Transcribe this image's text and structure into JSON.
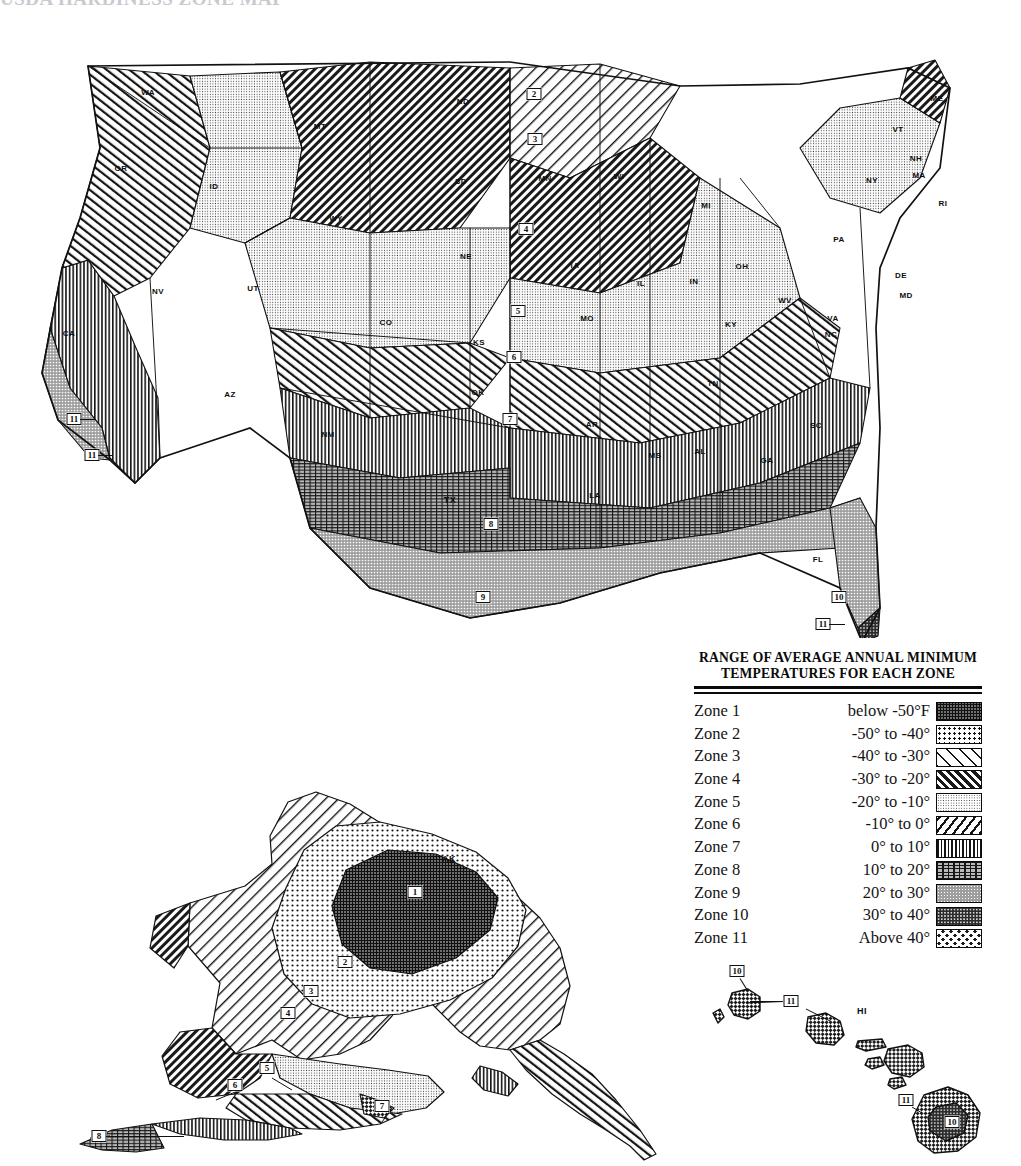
{
  "page": {
    "cut_off_title": "USDA HARDINESS ZONE MAP",
    "background_color": "#ffffff",
    "ink_color": "#111111"
  },
  "legend": {
    "title_line1": "RANGE OF AVERAGE ANNUAL MINIMUM",
    "title_line2": "TEMPERATURES FOR EACH ZONE",
    "columns": [
      "Zone",
      "Temperature range",
      "Pattern"
    ],
    "rows": [
      {
        "zone": "Zone 1",
        "range": "below -50°F",
        "pattern": "p1",
        "pattern_name": "fine-dark-grid"
      },
      {
        "zone": "Zone 2",
        "range": "-50° to -40°",
        "pattern": "p2",
        "pattern_name": "coarse-dots"
      },
      {
        "zone": "Zone 3",
        "range": "-40° to -30°",
        "pattern": "p3",
        "pattern_name": "sparse-backslash-hatch"
      },
      {
        "zone": "Zone 4",
        "range": "-30° to -20°",
        "pattern": "p4",
        "pattern_name": "dense-forward-hatch"
      },
      {
        "zone": "Zone 5",
        "range": "-20° to -10°",
        "pattern": "p5",
        "pattern_name": "fine-stipple"
      },
      {
        "zone": "Zone 6",
        "range": "-10° to   0°",
        "pattern": "p6",
        "pattern_name": "bold-backslash-hatch"
      },
      {
        "zone": "Zone 7",
        "range": "0° to  10°",
        "pattern": "p7",
        "pattern_name": "vertical-bars"
      },
      {
        "zone": "Zone 8",
        "range": "10° to  20°",
        "pattern": "p8",
        "pattern_name": "dash-stipple"
      },
      {
        "zone": "Zone 9",
        "range": "20° to  30°",
        "pattern": "p9",
        "pattern_name": "mid-gray-stipple"
      },
      {
        "zone": "Zone 10",
        "range": "30° to  40°",
        "pattern": "p10",
        "pattern_name": "dark-fine-dots"
      },
      {
        "zone": "Zone 11",
        "range": "Above   40°",
        "pattern": "p11",
        "pattern_name": "bold-checker"
      }
    ]
  },
  "maps": {
    "conus": {
      "name": "contiguous-united-states",
      "state_labels": [
        {
          "abbr": "WA",
          "x": 148,
          "y": 92
        },
        {
          "abbr": "OR",
          "x": 121,
          "y": 168
        },
        {
          "abbr": "ID",
          "x": 214,
          "y": 186
        },
        {
          "abbr": "MT",
          "x": 320,
          "y": 126
        },
        {
          "abbr": "WY",
          "x": 336,
          "y": 218
        },
        {
          "abbr": "NV",
          "x": 158,
          "y": 291
        },
        {
          "abbr": "UT",
          "x": 253,
          "y": 288
        },
        {
          "abbr": "CA",
          "x": 69,
          "y": 333
        },
        {
          "abbr": "AZ",
          "x": 230,
          "y": 394
        },
        {
          "abbr": "NM",
          "x": 328,
          "y": 434
        },
        {
          "abbr": "CO",
          "x": 386,
          "y": 322
        },
        {
          "abbr": "ND",
          "x": 463,
          "y": 101
        },
        {
          "abbr": "SD",
          "x": 461,
          "y": 181
        },
        {
          "abbr": "NE",
          "x": 466,
          "y": 256
        },
        {
          "abbr": "KS",
          "x": 479,
          "y": 342
        },
        {
          "abbr": "OK",
          "x": 478,
          "y": 392
        },
        {
          "abbr": "TX",
          "x": 450,
          "y": 500
        },
        {
          "abbr": "MN",
          "x": 545,
          "y": 178
        },
        {
          "abbr": "IA",
          "x": 575,
          "y": 265
        },
        {
          "abbr": "MO",
          "x": 587,
          "y": 318
        },
        {
          "abbr": "AR",
          "x": 592,
          "y": 424
        },
        {
          "abbr": "LA",
          "x": 595,
          "y": 495
        },
        {
          "abbr": "WI",
          "x": 619,
          "y": 176
        },
        {
          "abbr": "IL",
          "x": 641,
          "y": 283
        },
        {
          "abbr": "MI",
          "x": 706,
          "y": 205
        },
        {
          "abbr": "IN",
          "x": 694,
          "y": 281
        },
        {
          "abbr": "KY",
          "x": 731,
          "y": 324
        },
        {
          "abbr": "TN",
          "x": 713,
          "y": 383
        },
        {
          "abbr": "MS",
          "x": 655,
          "y": 455
        },
        {
          "abbr": "AL",
          "x": 700,
          "y": 451
        },
        {
          "abbr": "GA",
          "x": 767,
          "y": 460
        },
        {
          "abbr": "OH",
          "x": 742,
          "y": 266
        },
        {
          "abbr": "WV",
          "x": 785,
          "y": 300
        },
        {
          "abbr": "VA",
          "x": 833,
          "y": 318
        },
        {
          "abbr": "NC",
          "x": 831,
          "y": 334
        },
        {
          "abbr": "SC",
          "x": 816,
          "y": 425
        },
        {
          "abbr": "FL",
          "x": 818,
          "y": 559
        },
        {
          "abbr": "PA",
          "x": 839,
          "y": 239
        },
        {
          "abbr": "NY",
          "x": 872,
          "y": 180
        },
        {
          "abbr": "VT",
          "x": 898,
          "y": 129
        },
        {
          "abbr": "NH",
          "x": 916,
          "y": 158
        },
        {
          "abbr": "MA",
          "x": 919,
          "y": 175
        },
        {
          "abbr": "ME",
          "x": 937,
          "y": 98
        },
        {
          "abbr": "RI",
          "x": 943,
          "y": 203
        },
        {
          "abbr": "DE",
          "x": 901,
          "y": 275
        },
        {
          "abbr": "MD",
          "x": 906,
          "y": 295
        }
      ],
      "zone_markers": [
        {
          "zone": "2",
          "x": 534,
          "y": 94
        },
        {
          "zone": "3",
          "x": 535,
          "y": 139
        },
        {
          "zone": "4",
          "x": 526,
          "y": 229
        },
        {
          "zone": "5",
          "x": 518,
          "y": 311
        },
        {
          "zone": "6",
          "x": 514,
          "y": 357
        },
        {
          "zone": "7",
          "x": 510,
          "y": 419
        },
        {
          "zone": "8",
          "x": 491,
          "y": 524
        },
        {
          "zone": "9",
          "x": 483,
          "y": 597
        },
        {
          "zone": "10",
          "x": 839,
          "y": 597
        },
        {
          "zone": "11",
          "x": 823,
          "y": 624
        },
        {
          "zone": "11",
          "x": 74,
          "y": 419
        },
        {
          "zone": "11",
          "x": 92,
          "y": 455
        }
      ]
    },
    "alaska": {
      "name": "alaska-inset",
      "state_labels": [
        {
          "abbr": "AK",
          "x": 449,
          "y": 859
        }
      ],
      "zone_markers": [
        {
          "zone": "1",
          "x": 415,
          "y": 892
        },
        {
          "zone": "2",
          "x": 345,
          "y": 962
        },
        {
          "zone": "3",
          "x": 311,
          "y": 991
        },
        {
          "zone": "4",
          "x": 288,
          "y": 1013
        },
        {
          "zone": "5",
          "x": 267,
          "y": 1068
        },
        {
          "zone": "6",
          "x": 235,
          "y": 1085
        },
        {
          "zone": "7",
          "x": 382,
          "y": 1106
        },
        {
          "zone": "8",
          "x": 99,
          "y": 1136
        }
      ]
    },
    "hawaii": {
      "name": "hawaii-inset",
      "state_labels": [
        {
          "abbr": "HI",
          "x": 862,
          "y": 1011
        }
      ],
      "zone_markers": [
        {
          "zone": "10",
          "x": 737,
          "y": 971
        },
        {
          "zone": "11",
          "x": 791,
          "y": 1001
        },
        {
          "zone": "11",
          "x": 906,
          "y": 1100
        },
        {
          "zone": "10",
          "x": 952,
          "y": 1122
        }
      ]
    }
  }
}
